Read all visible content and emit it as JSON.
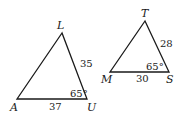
{
  "figure": {
    "stroke_color": "#1a1a1a",
    "triangles": [
      {
        "id": "LAU",
        "vertices": {
          "L": {
            "label": "L",
            "x": 62,
            "y": 33
          },
          "A": {
            "label": "A",
            "x": 17,
            "y": 99
          },
          "U": {
            "label": "U",
            "x": 87,
            "y": 99
          }
        },
        "side_LU": "35",
        "side_AU": "37",
        "angle_U": "65°"
      },
      {
        "id": "TMS",
        "vertices": {
          "T": {
            "label": "T",
            "x": 145,
            "y": 21
          },
          "M": {
            "label": "M",
            "x": 110,
            "y": 72
          },
          "S": {
            "label": "S",
            "x": 169,
            "y": 72
          }
        },
        "side_TS": "28",
        "side_MS": "30",
        "angle_S": "65°"
      }
    ]
  }
}
